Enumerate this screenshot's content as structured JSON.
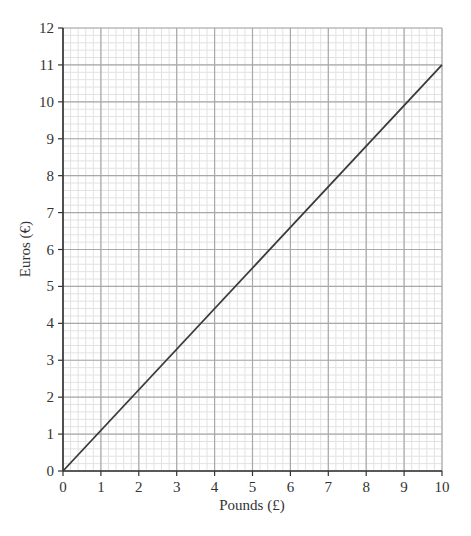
{
  "chart_data": {
    "type": "line",
    "title": "",
    "xlabel": "Pounds (£)",
    "ylabel": "Euros (€)",
    "xlim": [
      0,
      10
    ],
    "ylim": [
      0,
      12
    ],
    "x_ticks": [
      0,
      1,
      2,
      3,
      4,
      5,
      6,
      7,
      8,
      9,
      10
    ],
    "y_ticks": [
      0,
      1,
      2,
      3,
      4,
      5,
      6,
      7,
      8,
      9,
      10,
      11,
      12
    ],
    "grid": {
      "major": true,
      "minor": true,
      "minor_subdivisions": 5
    },
    "legend": null,
    "series": [
      {
        "name": "Conversion line",
        "x": [
          0,
          10
        ],
        "y": [
          0,
          11
        ],
        "color": "#3a3a3a"
      }
    ]
  },
  "colors": {
    "minor_grid": "#e2e2e2",
    "major_grid": "#a8a8a8",
    "axis": "#333333",
    "line": "#3a3a3a"
  }
}
